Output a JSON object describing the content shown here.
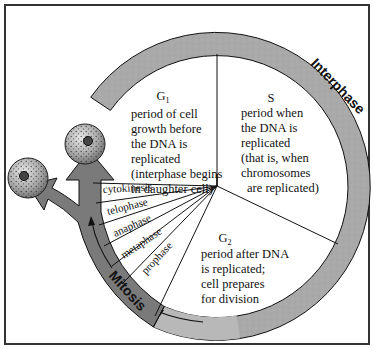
{
  "diagram": {
    "colors": {
      "border": "#333333",
      "interphase_ring": "#a9a9a9",
      "mitosis_arrow": "#7a7a7a",
      "mitosis_arrow_light": "#b8b8b8",
      "lines": "#111111",
      "background": "#ffffff"
    },
    "ring_labels": {
      "interphase": "Interphase",
      "mitosis": "Mitosis"
    },
    "sectors": {
      "g1": {
        "name": "G",
        "subscript": "1",
        "lines": [
          "period of cell",
          "growth before",
          "the DNA is",
          "replicated",
          "(interphase begins",
          "in daughter cell)"
        ]
      },
      "s": {
        "name": "S",
        "lines": [
          "period when",
          "the DNA is",
          "replicated",
          "(that is, when",
          "chromosomes",
          "are replicated)"
        ]
      },
      "g2": {
        "name": "G",
        "subscript": "2",
        "lines": [
          "period after DNA",
          "is replicated;",
          "cell prepares",
          "for division"
        ]
      }
    },
    "mitosis_phases": [
      "cytokinesis",
      "telophase",
      "anaphase",
      "metaphase",
      "prophase"
    ],
    "icons": {
      "parent_cell": "cell-icon",
      "daughter_cell_1": "cell-icon",
      "daughter_cell_2": "cell-icon"
    }
  }
}
